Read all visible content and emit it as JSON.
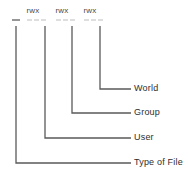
{
  "diagram": {
    "line_color": "#5a5a5a",
    "text_color": "#3a3a3a",
    "background": "#ffffff",
    "permission_string": {
      "file_type_char": "-",
      "groups": [
        {
          "id": "user",
          "label": "rwx"
        },
        {
          "id": "group",
          "label": "rwx"
        },
        {
          "id": "world",
          "label": "rwx"
        }
      ]
    },
    "callouts": [
      {
        "id": "world",
        "label": "World"
      },
      {
        "id": "group",
        "label": "Group"
      },
      {
        "id": "user",
        "label": "User"
      },
      {
        "id": "type-of-file",
        "label": "Type of File"
      }
    ]
  }
}
